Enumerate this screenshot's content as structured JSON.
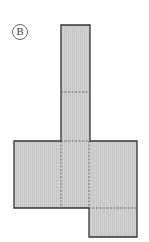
{
  "figure": {
    "label": "B",
    "fill_color": "#cfcfcf",
    "edge_color": "#333333",
    "fold_line_style": "dashed"
  }
}
